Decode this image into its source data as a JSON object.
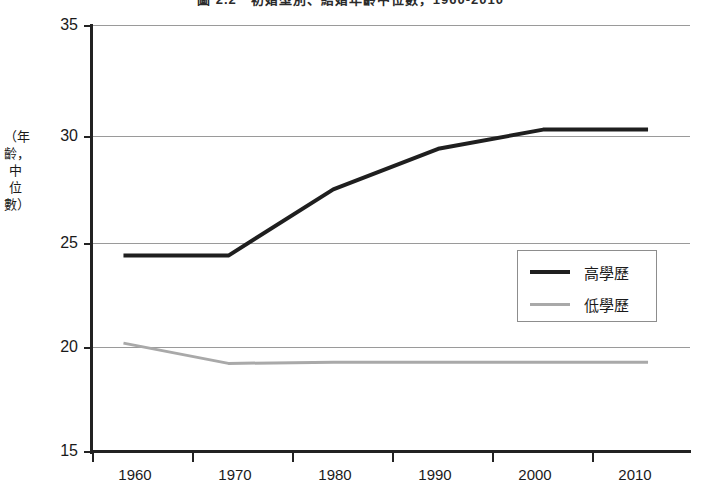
{
  "chart_data": {
    "type": "line",
    "title": "圖 2.2　初婚型別、結婚年齡中位數，1960-2010",
    "xlabel": "",
    "ylabel": "（年齡，中位數）",
    "x": [
      1960,
      1970,
      1980,
      1990,
      2000,
      2010
    ],
    "xlim": [
      1957,
      2014
    ],
    "ylim": [
      15,
      35
    ],
    "yticks": [
      35,
      30,
      25,
      20,
      15
    ],
    "xticks": [
      "1960",
      "1970",
      "1980",
      "1990",
      "2000",
      "2010"
    ],
    "grid": "horizontal",
    "legend_position": "center-right",
    "series": [
      {
        "name": "高學歷",
        "color": "#1f1f1f",
        "width": 4,
        "values": [
          24.2,
          24.2,
          27.3,
          29.2,
          30.1,
          30.1
        ]
      },
      {
        "name": "低學歷",
        "color": "#a9a9a9",
        "width": 3,
        "values": [
          20.1,
          19.15,
          19.2,
          19.2,
          19.2,
          19.2
        ]
      }
    ]
  },
  "axis": {
    "y_labels": [
      "35",
      "30",
      "25",
      "20",
      "15"
    ],
    "x_labels": [
      "1960",
      "1970",
      "1980",
      "1990",
      "2000",
      "2010"
    ],
    "y_title": "（年齡，中位數）"
  },
  "legend": {
    "entries": [
      {
        "label": "高學歷"
      },
      {
        "label": "低學歷"
      }
    ]
  }
}
